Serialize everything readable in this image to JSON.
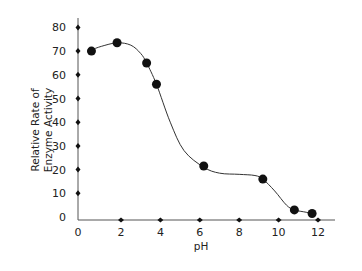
{
  "chart_data": {
    "type": "line",
    "title": "",
    "xlabel": "pH",
    "ylabel": [
      "Relative Rate of",
      "Enzyme Activity"
    ],
    "xlim": [
      0,
      13
    ],
    "ylim": [
      0,
      85
    ],
    "x_ticks": [
      0,
      2,
      4,
      6,
      8,
      10,
      12
    ],
    "y_ticks": [
      0,
      10,
      20,
      30,
      40,
      50,
      60,
      70,
      80
    ],
    "x_tick_labels": [
      "0",
      "2",
      "4",
      "6",
      "8",
      "10",
      "12"
    ],
    "y_tick_labels": [
      "0",
      "10",
      "20",
      "30",
      "40",
      "50",
      "60",
      "70",
      "80"
    ],
    "grid": false,
    "series": [
      {
        "name": "Enzyme activity",
        "points": [
          {
            "x": 0.5,
            "y": 70
          },
          {
            "x": 1.8,
            "y": 73.5
          },
          {
            "x": 3.3,
            "y": 65
          },
          {
            "x": 3.8,
            "y": 56
          },
          {
            "x": 6.2,
            "y": 21.5
          },
          {
            "x": 9.2,
            "y": 16
          },
          {
            "x": 10.8,
            "y": 3
          },
          {
            "x": 11.7,
            "y": 1.5
          }
        ],
        "curve": [
          {
            "x": 0.3,
            "y": 70
          },
          {
            "x": 0.5,
            "y": 70.5
          },
          {
            "x": 1.0,
            "y": 72
          },
          {
            "x": 1.8,
            "y": 73.5
          },
          {
            "x": 2.5,
            "y": 72.5
          },
          {
            "x": 3.0,
            "y": 69
          },
          {
            "x": 3.3,
            "y": 65
          },
          {
            "x": 3.8,
            "y": 56
          },
          {
            "x": 4.5,
            "y": 40
          },
          {
            "x": 5.2,
            "y": 28
          },
          {
            "x": 6.2,
            "y": 21
          },
          {
            "x": 7.0,
            "y": 18.5
          },
          {
            "x": 8.0,
            "y": 18
          },
          {
            "x": 8.8,
            "y": 17.5
          },
          {
            "x": 9.2,
            "y": 16
          },
          {
            "x": 9.8,
            "y": 11
          },
          {
            "x": 10.4,
            "y": 5
          },
          {
            "x": 10.8,
            "y": 3
          },
          {
            "x": 11.4,
            "y": 2
          },
          {
            "x": 11.9,
            "y": 1
          }
        ]
      }
    ]
  }
}
